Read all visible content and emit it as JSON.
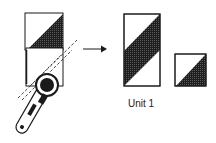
{
  "diagram": {
    "caption": "Unit 1",
    "colors": {
      "line": "#1a1a1a",
      "fill_dark": "#2b2b2b",
      "background": "#ffffff"
    },
    "steps": [
      {
        "name": "cut-step",
        "description": "rotary cutter cutting rectangle along diagonal with ruler"
      },
      {
        "name": "result-step",
        "description": "resulting unit pieces"
      }
    ]
  }
}
